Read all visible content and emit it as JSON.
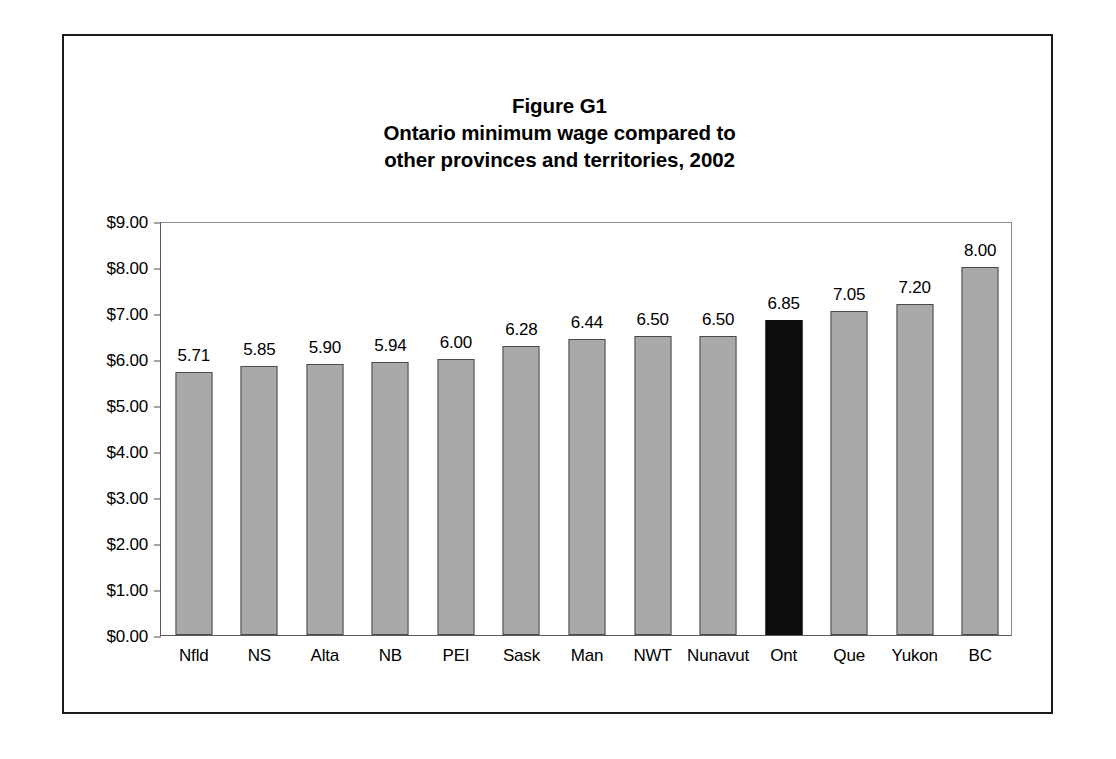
{
  "figure": {
    "title_lines": [
      "Figure G1",
      "Ontario minimum wage compared to",
      "other provinces and territories, 2002"
    ]
  },
  "chart_data": {
    "type": "bar",
    "xlabel": "",
    "ylabel": "",
    "ylim": [
      0,
      9
    ],
    "ytick_step": 1,
    "ytick_labels": [
      "$0.00",
      "$1.00",
      "$2.00",
      "$3.00",
      "$4.00",
      "$5.00",
      "$6.00",
      "$7.00",
      "$8.00",
      "$9.00"
    ],
    "grid": false,
    "legend": "none",
    "value_label_format": "0.00",
    "bar_color": "#a9a9a9",
    "bar_border_color": "#4c4c4c",
    "highlight_color": "#0d0d0d",
    "highlight_category": "Ont",
    "categories": [
      "Nfld",
      "NS",
      "Alta",
      "NB",
      "PEI",
      "Sask",
      "Man",
      "NWT",
      "Nunavut",
      "Ont",
      "Que",
      "Yukon",
      "BC"
    ],
    "values": [
      5.71,
      5.85,
      5.9,
      5.94,
      6.0,
      6.28,
      6.44,
      6.5,
      6.5,
      6.85,
      7.05,
      7.2,
      8.0
    ],
    "value_labels": [
      "5.71",
      "5.85",
      "5.90",
      "5.94",
      "6.00",
      "6.28",
      "6.44",
      "6.50",
      "6.50",
      "6.85",
      "7.05",
      "7.20",
      "8.00"
    ]
  }
}
